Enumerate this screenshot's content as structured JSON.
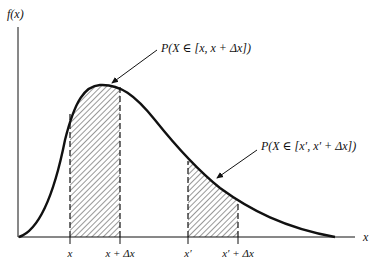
{
  "figure": {
    "type": "probability-density-diagram",
    "y_axis_label": "f(x)",
    "x_axis_label": "x",
    "curve": {
      "description": "right-skewed probability density function",
      "stroke_color": "#111111"
    },
    "shaded_regions": [
      {
        "name": "interval-near-peak",
        "from_label": "x",
        "to_label": "x + Δx",
        "annotation": "P(X ∈ [x, x + Δx])",
        "fill_pattern": "diagonal-hatch"
      },
      {
        "name": "interval-on-tail",
        "from_label": "x′",
        "to_label": "x′ + Δx",
        "annotation": "P(X ∈ [x′, x′ + Δx])",
        "fill_pattern": "diagonal-hatch"
      }
    ],
    "tick_labels": [
      "x",
      "x + Δx",
      "x′",
      "x′ + Δx"
    ],
    "colors": {
      "ink": "#111111",
      "hatch": "#333333",
      "background": "#ffffff"
    }
  }
}
